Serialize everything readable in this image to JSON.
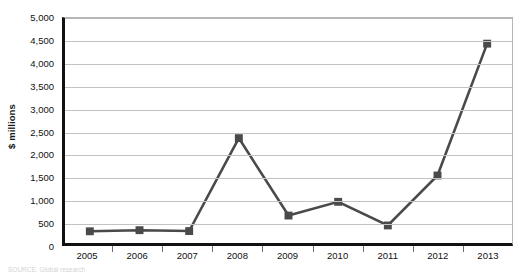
{
  "chart_data": {
    "type": "line",
    "title": "",
    "xlabel": "",
    "ylabel": "$ millions",
    "categories": [
      "2005",
      "2006",
      "2007",
      "2008",
      "2009",
      "2010",
      "2011",
      "2012",
      "2013"
    ],
    "values": [
      260,
      285,
      265,
      2330,
      610,
      915,
      390,
      1500,
      4430
    ],
    "series": [
      {
        "name": "$ millions",
        "values": [
          260,
          285,
          265,
          2330,
          610,
          915,
          390,
          1500,
          4430
        ]
      }
    ],
    "ylim": [
      0,
      5000
    ],
    "ytick_values": [
      0,
      500,
      1000,
      1500,
      2000,
      2500,
      3000,
      3500,
      4000,
      4500,
      5000
    ],
    "ytick_labels": [
      "0",
      "500",
      "1,000",
      "1,500",
      "2,000",
      "2,500",
      "3,000",
      "3,500",
      "4,000",
      "4,500",
      "5,000"
    ],
    "grid": true,
    "legend": false,
    "legend_position": "none",
    "line_color": "#4a4a4a",
    "marker_color": "#4a4a4a",
    "marker_shape": "square",
    "annotations": []
  },
  "footer": {
    "source_note": "SOURCE: Global research"
  }
}
